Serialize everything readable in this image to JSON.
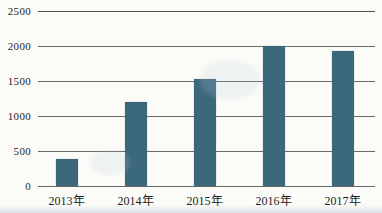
{
  "chart_data": {
    "type": "bar",
    "title": "",
    "categories": [
      "2013年",
      "2014年",
      "2015年",
      "2016年",
      "2017年"
    ],
    "values": [
      390,
      1200,
      1530,
      2000,
      1930
    ],
    "xlabel": "",
    "ylabel": "",
    "ylim": [
      0,
      2500
    ],
    "ytick_interval": 500,
    "ytick_labels": [
      "0",
      "500",
      "1000",
      "1500",
      "2000",
      "2500"
    ],
    "grid": "horizontal",
    "legend": "none",
    "bar_color": "#3c687e",
    "gridline_color": "#6a6a6a",
    "text_color": "#1f1f1f",
    "background_color": "#fbfbf8"
  }
}
